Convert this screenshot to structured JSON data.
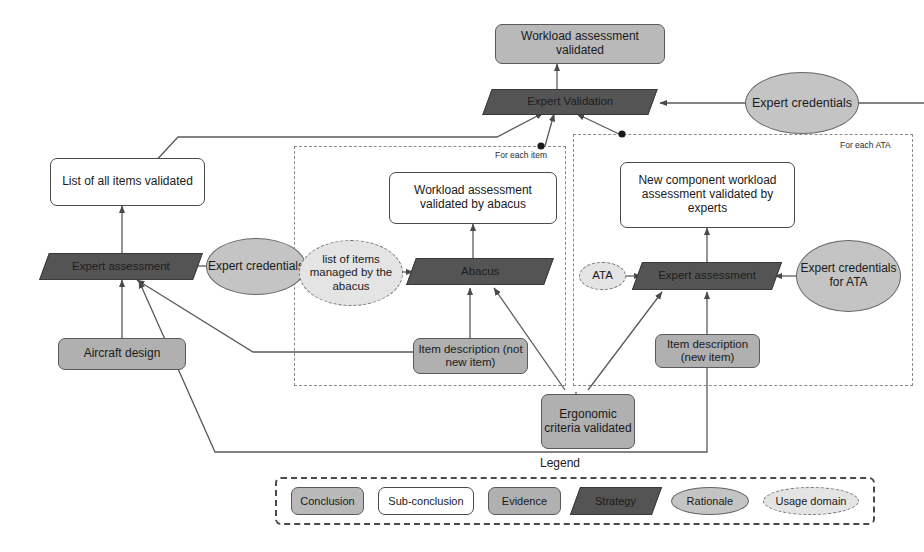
{
  "diagram": {
    "nodes": {
      "workload_assessment_validated": "Workload assessment validated",
      "expert_validation": "Expert Validation",
      "expert_credentials_top": "Expert credentials",
      "list_of_all_items_validated": "List of all items validated",
      "expert_assessment_left": "Expert assessment",
      "expert_credentials_left": "Expert credentials",
      "aircraft_design": "Aircraft design",
      "workload_assessment_by_abacus": "Workload assessment validated by abacus",
      "list_of_items_managed": "list of items managed by the abacus",
      "abacus": "Abacus",
      "item_description_not_new": "Item description (not new item)",
      "new_component_workload": "New component workload assessment validated by experts",
      "ata": "ATA",
      "expert_assessment_ata": "Expert assessment",
      "expert_credentials_ata": "Expert credentials for ATA",
      "item_description_new": "Item description (new item)",
      "ergonomic_criteria_validated": "Ergonomic criteria validated"
    },
    "containers": {
      "for_each_item": "For each item",
      "for_each_ata": "For each ATA"
    },
    "legend": {
      "title": "Legend",
      "items": [
        {
          "label": "Conclusion",
          "shape": "rounded-rect",
          "fill": "#b9b9b9"
        },
        {
          "label": "Sub-conclusion",
          "shape": "rounded-rect",
          "fill": "#ffffff"
        },
        {
          "label": "Evidence",
          "shape": "rounded-rect",
          "fill": "#b0b0b0"
        },
        {
          "label": "Strategy",
          "shape": "parallelogram",
          "fill": "#545454"
        },
        {
          "label": "Rationale",
          "shape": "ellipse",
          "fill": "#c4c4c4"
        },
        {
          "label": "Usage domain",
          "shape": "ellipse-dashed",
          "fill": "#e4e4e4"
        }
      ]
    },
    "colors": {
      "conclusion_fill": "#b9b9b9",
      "subconclusion_fill": "#ffffff",
      "evidence_fill": "#b0b0b0",
      "strategy_fill": "#545454",
      "rationale_fill": "#c4c4c4",
      "usage_domain_fill": "#e4e4e4",
      "connector": "#5a5a5a",
      "container_border": "#8a8a8a"
    }
  }
}
